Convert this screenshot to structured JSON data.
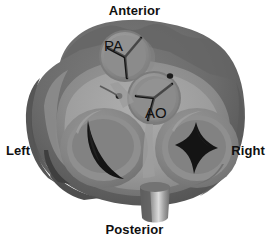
{
  "figure": {
    "background_color": "#ffffff"
  },
  "orientation_labels": [
    {
      "id": "anterior",
      "text": "Anterior",
      "position": "top"
    },
    {
      "id": "posterior",
      "text": "Posterior",
      "position": "bottom"
    },
    {
      "id": "left",
      "text": "Left",
      "position": "left"
    },
    {
      "id": "right",
      "text": "Right",
      "position": "right"
    }
  ],
  "valves": [
    {
      "id": "pulmonary-valve",
      "tag": "PA",
      "name": "Pulmonary valve",
      "shape": "circular-semilunar",
      "closure_pattern": "tri-radiate",
      "cusps": 3,
      "center": [
        125,
        56
      ],
      "radius": 25,
      "tag_position": [
        106,
        46
      ]
    },
    {
      "id": "aortic-valve",
      "tag": "AO",
      "name": "Aortic valve",
      "shape": "circular-semilunar",
      "closure_pattern": "tri-radiate",
      "cusps": 3,
      "center": [
        154,
        98
      ],
      "radius": 26,
      "tag_position": [
        146,
        113
      ]
    },
    {
      "id": "mitral-valve",
      "tag": "",
      "name": "Mitral valve",
      "shape": "oval",
      "closure_pattern": "crescent-orifice",
      "cusps": 2,
      "center": [
        104,
        148
      ],
      "radius": 42,
      "tag_position": [
        0,
        0
      ]
    },
    {
      "id": "tricuspid-valve",
      "tag": "",
      "name": "Tricuspid valve",
      "shape": "oval",
      "closure_pattern": "three-pointed-orifice",
      "cusps": 3,
      "center": [
        196,
        148
      ],
      "radius": 40,
      "tag_position": [
        0,
        0
      ]
    }
  ],
  "coronary_ostia": [
    {
      "id": "left-coronary-ostium",
      "center": [
        119,
        96
      ],
      "radius": 3
    },
    {
      "id": "right-coronary-ostium",
      "center": [
        170,
        76
      ],
      "radius": 3
    }
  ],
  "structures": [
    {
      "id": "myocardium-outer-rim",
      "name": "Outer myocardial wall"
    },
    {
      "id": "fibrous-skeleton",
      "name": "Fibrous skeleton / annulus"
    },
    {
      "id": "inferior-stem",
      "name": "Inferior vessel stem"
    }
  ],
  "palette": {
    "background": "#ffffff",
    "wall_dark": "#595959",
    "wall_mid": "#6e6e6e",
    "wall_light": "#8a8a8a",
    "annulus_light": "#9a9a9a",
    "annulus_pale": "#a9a9a9",
    "valve_face": "#8d8d8d",
    "valve_shadow": "#777777",
    "orifice_black": "#141414",
    "label_color": "#101010",
    "stem_highlight": "#d8d8d8"
  }
}
